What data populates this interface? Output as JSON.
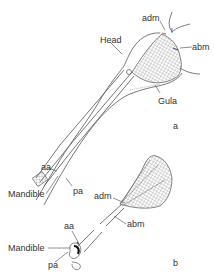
{
  "figure": {
    "panel_a": {
      "label": "a",
      "structures": {
        "head": "Head",
        "adm": "adm",
        "abm": "abm",
        "gula": "Gula",
        "aa": "aa",
        "mandible": "Mandible",
        "pa": "pa"
      }
    },
    "panel_b": {
      "label": "b",
      "structures": {
        "adm": "adm",
        "abm": "abm",
        "aa": "aa",
        "mandible": "Mandible",
        "pa": "pa"
      }
    },
    "colors": {
      "outline": "#555555",
      "muscle_hatch": "#777777",
      "adm_marker": "#e06070",
      "abm_marker": "#4050c0",
      "abm_leader_accent": "#c8c840",
      "text": "#333333"
    }
  }
}
